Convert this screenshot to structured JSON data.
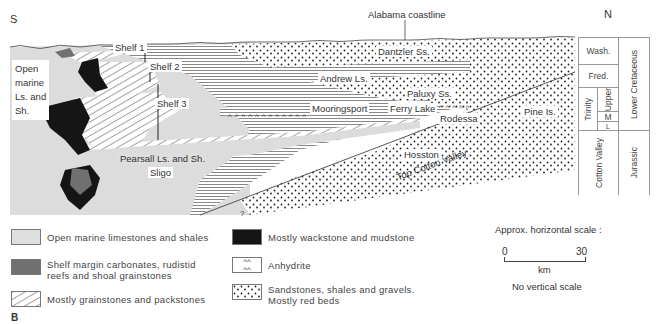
{
  "compass": {
    "south": "S",
    "north": "N"
  },
  "annotations": {
    "alabama_coastline": "Alabama coastline",
    "open_marine": [
      "Open",
      "marine",
      "Ls. and",
      "Sh."
    ],
    "shelf_1": "Shelf 1",
    "shelf_2": "Shelf 2",
    "shelf_3": "Shelf 3",
    "dantzler": "Dantzler Ss.",
    "andrew": "Andrew Ls.",
    "paluxy": "Paluxy Ss.",
    "mooringsport": "Mooringsport",
    "ferry_lake": "Ferry Lake",
    "rodessa": "Rodessa",
    "pine_island": "Pine Is.",
    "pearsall": "Pearsall Ls. and Sh.",
    "sligo": "Sligo",
    "hosston": "Hosston",
    "top_cotton_valley": "Top Cotton Valley",
    "question_mark": "?"
  },
  "strat_column": {
    "washita": "Wash.",
    "fredericksburg": "Fred.",
    "trinity": "Trinity",
    "upper": "Upper",
    "middle": "M",
    "lower": "L",
    "cotton_valley": "Cotton Valley",
    "lower_cretaceous": "Lower Cretaceous",
    "jurassic": "Jurassic"
  },
  "legend": {
    "items": [
      {
        "label": "Open marine limestones and shales",
        "pattern": "light-grey"
      },
      {
        "label": "Shelf margin carbonates, rudistid reefs and shoal grainstones",
        "pattern": "dark-grey"
      },
      {
        "label": "Mostly grainstones and packstones",
        "pattern": "diagonal-hatch"
      },
      {
        "label": "Mostly wackstone and mudstone",
        "pattern": "black"
      },
      {
        "label": "Anhydrite",
        "pattern": "carets"
      },
      {
        "label": "Sandstones, shales and gravels. Mostly red beds",
        "pattern": "dots"
      }
    ],
    "item_1_line1": "Shelf margin carbonates, rudistid",
    "item_1_line2": "reefs and shoal grainstones",
    "item_5_line1": "Sandstones, shales and gravels.",
    "item_5_line2": "Mostly red beds"
  },
  "scale": {
    "title": "Approx. horizontal scale :",
    "start": "0",
    "end": "30",
    "unit": "km",
    "note": "No vertical scale"
  },
  "figure_label": "B",
  "colors": {
    "open_marine": "#dcdcdc",
    "shelf_margin": "#707070",
    "wackstone": "#151515",
    "line": "#555555"
  }
}
